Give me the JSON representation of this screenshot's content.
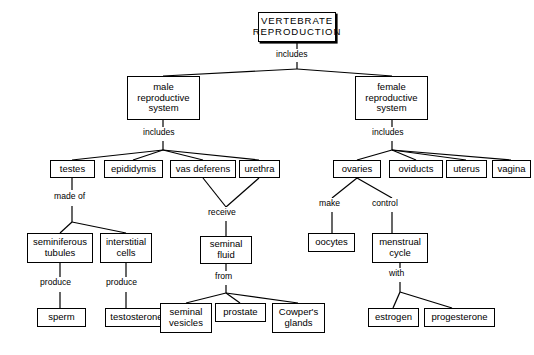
{
  "diagram": {
    "title": "VERTEBRATE REPRODUCTION",
    "type": "concept-map",
    "nodes": [
      {
        "id": "root",
        "label": "VERTEBRATE\nREPRODUCTION",
        "x": 258,
        "y": 12,
        "w": 78,
        "h": 30,
        "root": true
      },
      {
        "id": "male",
        "label": "male\nreproductive\nsystem",
        "x": 127,
        "y": 76,
        "w": 73,
        "h": 44
      },
      {
        "id": "female",
        "label": "female\nreproductive\nsystem",
        "x": 355,
        "y": 76,
        "w": 73,
        "h": 44
      },
      {
        "id": "testes",
        "label": "testes",
        "x": 50,
        "y": 160,
        "w": 45,
        "h": 18
      },
      {
        "id": "epididymis",
        "label": "epididymis",
        "x": 104,
        "y": 160,
        "w": 59,
        "h": 18
      },
      {
        "id": "vas-deferens",
        "label": "vas  deferens",
        "x": 170,
        "y": 160,
        "w": 66,
        "h": 18
      },
      {
        "id": "urethra",
        "label": "urethra",
        "x": 239,
        "y": 160,
        "w": 41,
        "h": 18
      },
      {
        "id": "ovaries",
        "label": "ovaries",
        "x": 333,
        "y": 160,
        "w": 48,
        "h": 18
      },
      {
        "id": "oviducts",
        "label": "oviducts",
        "x": 389,
        "y": 160,
        "w": 54,
        "h": 18
      },
      {
        "id": "uterus",
        "label": "uterus",
        "x": 446,
        "y": 160,
        "w": 41,
        "h": 18
      },
      {
        "id": "vagina",
        "label": "vagina",
        "x": 492,
        "y": 160,
        "w": 39,
        "h": 18
      },
      {
        "id": "seminiferous",
        "label": "seminiferous\ntubules",
        "x": 27,
        "y": 233,
        "w": 66,
        "h": 30
      },
      {
        "id": "interstitial",
        "label": "interstitial\ncells",
        "x": 100,
        "y": 233,
        "w": 52,
        "h": 30
      },
      {
        "id": "seminal-fluid",
        "label": "seminal\nfluid",
        "x": 200,
        "y": 236,
        "w": 52,
        "h": 28
      },
      {
        "id": "oocytes",
        "label": "oocytes",
        "x": 308,
        "y": 233,
        "w": 47,
        "h": 19
      },
      {
        "id": "menstrual-cycle",
        "label": "menstrual\ncycle",
        "x": 372,
        "y": 233,
        "w": 56,
        "h": 30
      },
      {
        "id": "sperm",
        "label": "sperm",
        "x": 37,
        "y": 308,
        "w": 49,
        "h": 19
      },
      {
        "id": "testosterone",
        "label": "testosterone",
        "x": 105,
        "y": 308,
        "w": 63,
        "h": 19
      },
      {
        "id": "seminal-vesicles",
        "label": "seminal\nvesicles",
        "x": 160,
        "y": 303,
        "w": 52,
        "h": 30
      },
      {
        "id": "prostate",
        "label": "prostate",
        "x": 215,
        "y": 303,
        "w": 51,
        "h": 19
      },
      {
        "id": "cowpers-glands",
        "label": "Cowper's\nglands",
        "x": 272,
        "y": 303,
        "w": 53,
        "h": 30
      },
      {
        "id": "estrogen",
        "label": "estrogen",
        "x": 368,
        "y": 308,
        "w": 51,
        "h": 19
      },
      {
        "id": "progesterone",
        "label": "progesterone",
        "x": 424,
        "y": 308,
        "w": 71,
        "h": 19
      }
    ],
    "linking_words": [
      {
        "id": "link-root-includes",
        "text": "includes",
        "x": 275,
        "y": 53
      },
      {
        "id": "link-male-includes",
        "text": "includes",
        "x": 142,
        "y": 131
      },
      {
        "id": "link-female-includes",
        "text": "includes",
        "x": 370,
        "y": 131
      },
      {
        "id": "link-testes-madeof",
        "text": "made of",
        "x": 53,
        "y": 195
      },
      {
        "id": "link-vas-receive",
        "text": "receive",
        "x": 205,
        "y": 213
      },
      {
        "id": "link-seminal-from",
        "text": "from",
        "x": 213,
        "y": 275
      },
      {
        "id": "link-seminiferous-prod",
        "text": "produce",
        "x": 38,
        "y": 283
      },
      {
        "id": "link-interstitial-prod",
        "text": "produce",
        "x": 107,
        "y": 283
      },
      {
        "id": "link-ovaries-make",
        "text": "make",
        "x": 322,
        "y": 204
      },
      {
        "id": "link-ovaries-control",
        "text": "control",
        "x": 371,
        "y": 204
      },
      {
        "id": "link-menstrual-with",
        "text": "with",
        "x": 388,
        "y": 273
      }
    ],
    "edges": [
      {
        "from": "root",
        "to": "male",
        "path": "M297,42 L297,48 M297,61 L297,68 L163,76"
      },
      {
        "from": "root",
        "to": "female",
        "path": "M297,68 L392,76"
      },
      {
        "from": "male",
        "to": "testes",
        "path": "M163,120 L163,126 M163,140 L163,150 L72,160"
      },
      {
        "from": "male",
        "to": "epididymis",
        "path": "M163,150 L133,160"
      },
      {
        "from": "male",
        "to": "vas-deferens",
        "path": "M163,150 L203,160"
      },
      {
        "from": "male",
        "to": "urethra",
        "path": "M163,150 L259,160"
      },
      {
        "from": "female",
        "to": "ovaries",
        "path": "M392,120 L392,126 M392,140 L392,150 L357,160"
      },
      {
        "from": "female",
        "to": "oviducts",
        "path": "M392,150 L416,160"
      },
      {
        "from": "female",
        "to": "uterus",
        "path": "M392,150 L466,160"
      },
      {
        "from": "female",
        "to": "vagina",
        "path": "M392,150 L511,160"
      },
      {
        "from": "testes",
        "to": "seminiferous",
        "path": "M72,178 L72,190 M72,205 L72,222 L60,233"
      },
      {
        "from": "testes",
        "to": "interstitial",
        "path": "M72,222 L126,233"
      },
      {
        "from": "vas-deferens",
        "to": "seminal-fluid",
        "path": "M203,178 L226,208"
      },
      {
        "from": "urethra",
        "to": "seminal-fluid",
        "path": "M259,178 L226,208"
      },
      {
        "from": "receive",
        "to": "seminal-fluid",
        "path": "M226,208 L226,210 M226,224 L226,236"
      },
      {
        "from": "seminal-fluid",
        "to": "seminal-vesicles",
        "path": "M226,264 L226,270 M226,285 L226,293 L186,303"
      },
      {
        "from": "seminal-fluid",
        "to": "prostate",
        "path": "M226,293 L240,303"
      },
      {
        "from": "seminal-fluid",
        "to": "cowpers-glands",
        "path": "M226,293 L298,303"
      },
      {
        "from": "seminiferous",
        "to": "sperm",
        "path": "M60,263 L60,278 M60,293 L60,308"
      },
      {
        "from": "interstitial",
        "to": "testosterone",
        "path": "M126,263 L126,278 M126,293 L126,308"
      },
      {
        "from": "ovaries",
        "to": "oocytes",
        "path": "M357,178 L332,199 M332,211 L332,233"
      },
      {
        "from": "ovaries",
        "to": "menstrual-cycle",
        "path": "M357,178 L392,199 M392,211 L392,233"
      },
      {
        "from": "menstrual-cycle",
        "to": "estrogen",
        "path": "M400,263 L400,268 M400,283 L400,292 L393,308"
      },
      {
        "from": "menstrual-cycle",
        "to": "progesterone",
        "path": "M400,292 L452,308"
      }
    ]
  }
}
